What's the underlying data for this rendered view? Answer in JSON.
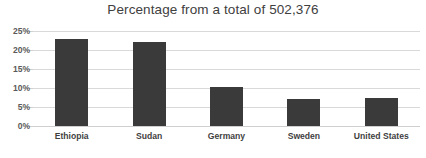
{
  "chart_data": {
    "type": "bar",
    "title": "Percentage from a total of 502,376",
    "xlabel": "",
    "ylabel": "",
    "categories": [
      "Ethiopia",
      "Sudan",
      "Germany",
      "Sweden",
      "United States"
    ],
    "values": [
      23.0,
      22.0,
      10.2,
      7.2,
      7.4
    ],
    "ylim": [
      0,
      25
    ],
    "ytick_labels": [
      "25%",
      "20%",
      "15%",
      "10%",
      "5%",
      "0%"
    ],
    "ytick_values": [
      25,
      20,
      15,
      10,
      5,
      0
    ],
    "grid": true,
    "legend": false,
    "bar_color": "#3a3a3a",
    "gridline_color": "#d9d9d9",
    "title_color": "#404040",
    "label_color": "#3f3f3f"
  }
}
